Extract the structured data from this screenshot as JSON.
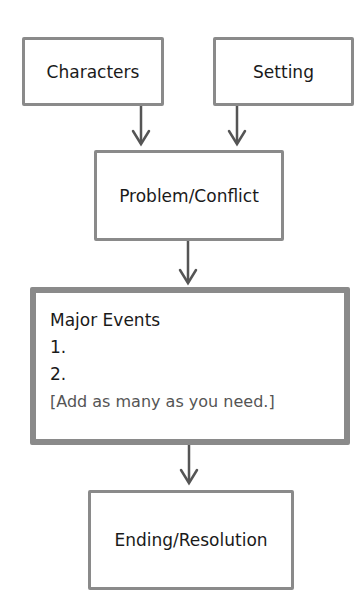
{
  "diagram": {
    "nodes": {
      "characters": "Characters",
      "setting": "Setting",
      "problem": "Problem/Conflict",
      "events_title": "Major Events",
      "event_1": "1.",
      "event_2": "2.",
      "events_hint": "[Add as many as you need.]",
      "ending": "Ending/Resolution"
    },
    "colors": {
      "border": "#8a8a8a",
      "arrow": "#555555",
      "text": "#1a1a1a"
    }
  }
}
